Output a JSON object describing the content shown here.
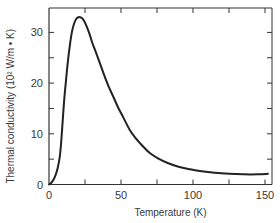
{
  "chart_data": {
    "type": "line",
    "title": "",
    "xlabel": "Temperature (K)",
    "ylabel": "Thermal conductivity (10² W/m • K)",
    "xlim": [
      0,
      152
    ],
    "ylim": [
      0,
      35
    ],
    "x_ticks_major": [
      0,
      50,
      100,
      150
    ],
    "x_ticks_minor": [
      25,
      75,
      125
    ],
    "y_ticks_major": [
      0,
      10,
      20,
      30
    ],
    "y_ticks_minor": [
      5,
      15,
      25
    ],
    "x_tick_labels": [
      "0",
      "50",
      "100",
      "150"
    ],
    "y_tick_labels": [
      "0",
      "10",
      "20",
      "30"
    ],
    "grid": false,
    "legend": null,
    "line_color": "#222222",
    "series": [
      {
        "name": "Thermal conductivity",
        "x": [
          0,
          1.5,
          3,
          4.5,
          6,
          7.5,
          8.5,
          9.5,
          10.5,
          11.8,
          13,
          14.5,
          16,
          17.5,
          19,
          20.5,
          21.5,
          23,
          24.5,
          26,
          28,
          30,
          32,
          35,
          38,
          41,
          44.5,
          48,
          52,
          56,
          60,
          65,
          70,
          76,
          82,
          90,
          98,
          106,
          115,
          125,
          135,
          145,
          152
        ],
        "y": [
          0,
          0.3,
          0.9,
          1.8,
          3.2,
          5.5,
          8.5,
          12.5,
          16.5,
          20.5,
          24,
          27.5,
          30.2,
          31.8,
          32.7,
          33.0,
          33.0,
          32.8,
          32.2,
          31.3,
          29.8,
          28.0,
          26.5,
          24.2,
          21.8,
          19.6,
          17.4,
          15.2,
          13.0,
          10.8,
          9.2,
          7.6,
          6.2,
          5.1,
          4.3,
          3.5,
          3.0,
          2.6,
          2.3,
          2.1,
          2.0,
          2.0,
          2.1
        ]
      }
    ]
  }
}
